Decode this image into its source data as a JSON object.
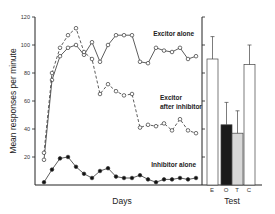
{
  "chart_data": [
    {
      "type": "line",
      "title": "",
      "xlabel": "Days",
      "ylabel": "Mean responses per minute",
      "ylim": [
        0,
        120
      ],
      "yticks": [
        20,
        40,
        60,
        80,
        100,
        120
      ],
      "grid": false,
      "x": [
        1,
        2,
        3,
        4,
        5,
        6,
        7,
        8,
        9,
        10,
        11,
        12,
        13,
        14,
        15,
        16,
        17,
        18,
        19,
        20
      ],
      "series": [
        {
          "name": "Excitor alone",
          "marker": "open-circle",
          "linestyle": "solid",
          "values": [
            18,
            75,
            92,
            98,
            100,
            93,
            102,
            88,
            100,
            107,
            107,
            107,
            88,
            87,
            98,
            96,
            95,
            98,
            90,
            92
          ]
        },
        {
          "name": "Excitor after inhibitor",
          "marker": "open-circle",
          "linestyle": "dashed",
          "values": [
            23,
            80,
            98,
            107,
            112,
            95,
            90,
            65,
            72,
            67,
            64,
            65,
            41,
            43,
            42,
            44,
            39,
            47,
            39,
            37
          ]
        },
        {
          "name": "Inhibitor alone",
          "marker": "filled-circle",
          "linestyle": "solid",
          "values": [
            2,
            11,
            19,
            20,
            13,
            8,
            5,
            10,
            12,
            6,
            5,
            5,
            7,
            4,
            2,
            4,
            4,
            5,
            4,
            5
          ]
        }
      ]
    },
    {
      "type": "bar",
      "title": "",
      "xlabel": "Test",
      "ylabel": "",
      "ylim": [
        0,
        120
      ],
      "categories": [
        "E",
        "O",
        "T",
        "C"
      ],
      "values": [
        90,
        43,
        37,
        86
      ],
      "error_upper": [
        106,
        59,
        53,
        100
      ],
      "fills": [
        "#ffffff",
        "#1a1a1a",
        "#d8d8d8",
        "#ffffff"
      ]
    }
  ],
  "labels": {
    "y_axis": "Mean responses per minute",
    "x_axis_left": "Days",
    "x_axis_right": "Test",
    "series1": "Excitor alone",
    "series2_line1": "Excitor",
    "series2_line2": "after inhibitor",
    "series3": "Inhibitor alone",
    "ticks": [
      "120",
      "100",
      "80",
      "60",
      "40",
      "20"
    ],
    "bar_cats": [
      "E",
      "O",
      "T",
      "C"
    ]
  }
}
